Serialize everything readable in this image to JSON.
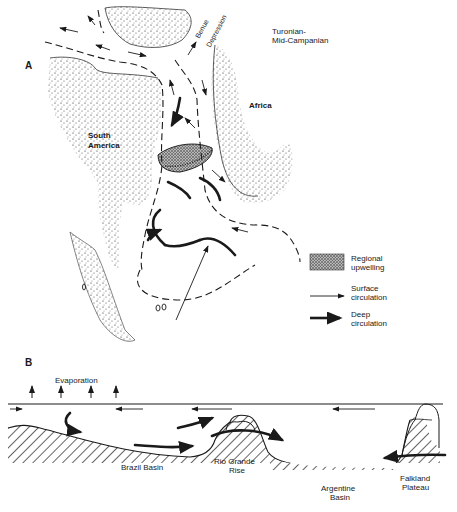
{
  "figure": {
    "panel_a": {
      "letter": "A",
      "time_label_line1": "Turonian-",
      "time_label_line2": "Mid-Campanian",
      "landmass_labels": {
        "south_america_line1": "South",
        "south_america_line2": "America",
        "africa": "Africa"
      },
      "feature_labels": {
        "benue_line1": "Benue",
        "benue_line2": "Depression"
      },
      "legend": {
        "items": [
          {
            "symbol": "stippled-patch",
            "label_line1": "Regional",
            "label_line2": "upwelling"
          },
          {
            "symbol": "thin-arrow",
            "label_line1": "Surface",
            "label_line2": "circulation"
          },
          {
            "symbol": "thick-arrow",
            "label_line1": "Deep",
            "label_line2": "circulation"
          }
        ]
      }
    },
    "panel_b": {
      "letter": "B",
      "process_label": "Evaporation",
      "features": [
        {
          "label_line1": "Brazil Basin",
          "label_line2": ""
        },
        {
          "label_line1": "Rio Grande",
          "label_line2": "Rise"
        },
        {
          "label_line1": "Argentine",
          "label_line2": "Basin"
        },
        {
          "label_line1": "Falkland",
          "label_line2": "Plateau"
        }
      ]
    },
    "colors": {
      "ink": "#1a1a1a",
      "background": "#ffffff"
    }
  }
}
